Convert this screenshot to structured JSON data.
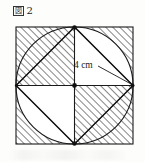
{
  "figure": {
    "label_box": "図",
    "label_number": "2",
    "label_full": "図 2",
    "dimension_label": "4 cm",
    "colors": {
      "stroke": "#1a1a1a",
      "hatch": "#2b2b2b",
      "background": "#fdfdfb",
      "fill_white": "#ffffff"
    },
    "geometry": {
      "square": {
        "x": 16,
        "y": 27,
        "size": 117
      },
      "circle": {
        "cx": 74.5,
        "cy": 85.5,
        "r": 58.5
      },
      "center_point": {
        "x": 74.5,
        "y": 85.5
      },
      "midpoints": [
        {
          "name": "top",
          "x": 74.5,
          "y": 27
        },
        {
          "name": "right",
          "x": 133,
          "y": 85.5
        },
        {
          "name": "bottom",
          "x": 74.5,
          "y": 144
        },
        {
          "name": "left",
          "x": 16,
          "y": 85.5
        }
      ],
      "hatched_quadrants": [
        "top-left",
        "bottom-right"
      ],
      "hatched_corner_segments": [
        "top-right",
        "bottom-left"
      ],
      "dimension_line": {
        "from": "center",
        "to": "right-midpoint",
        "value": "4 cm"
      }
    }
  }
}
